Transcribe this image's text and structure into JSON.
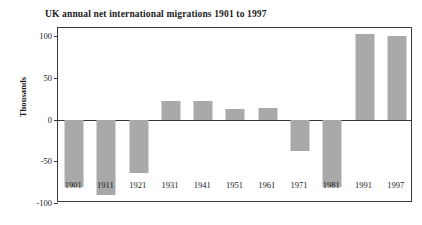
{
  "chart_data": {
    "type": "bar",
    "title": "UK annual net international migrations 1901 to 1997",
    "xlabel": "",
    "ylabel": "Thousands",
    "categories": [
      "1901",
      "1911",
      "1921",
      "1931",
      "1941",
      "1951",
      "1961",
      "1971",
      "1981",
      "1991",
      "1997"
    ],
    "values": [
      -81,
      -91,
      -64,
      23,
      22,
      13,
      14,
      -38,
      -81,
      103,
      101
    ],
    "ylim": [
      -100,
      110
    ],
    "yticks": [
      100,
      50,
      0,
      -50,
      -100
    ],
    "ytick_labels": [
      "100",
      "50",
      "0",
      "-50",
      "-100"
    ],
    "grid": false,
    "legend": false,
    "bar_color": "#a9a9a9",
    "axis_color": "#3a3a3a",
    "background": "#ffffff"
  }
}
